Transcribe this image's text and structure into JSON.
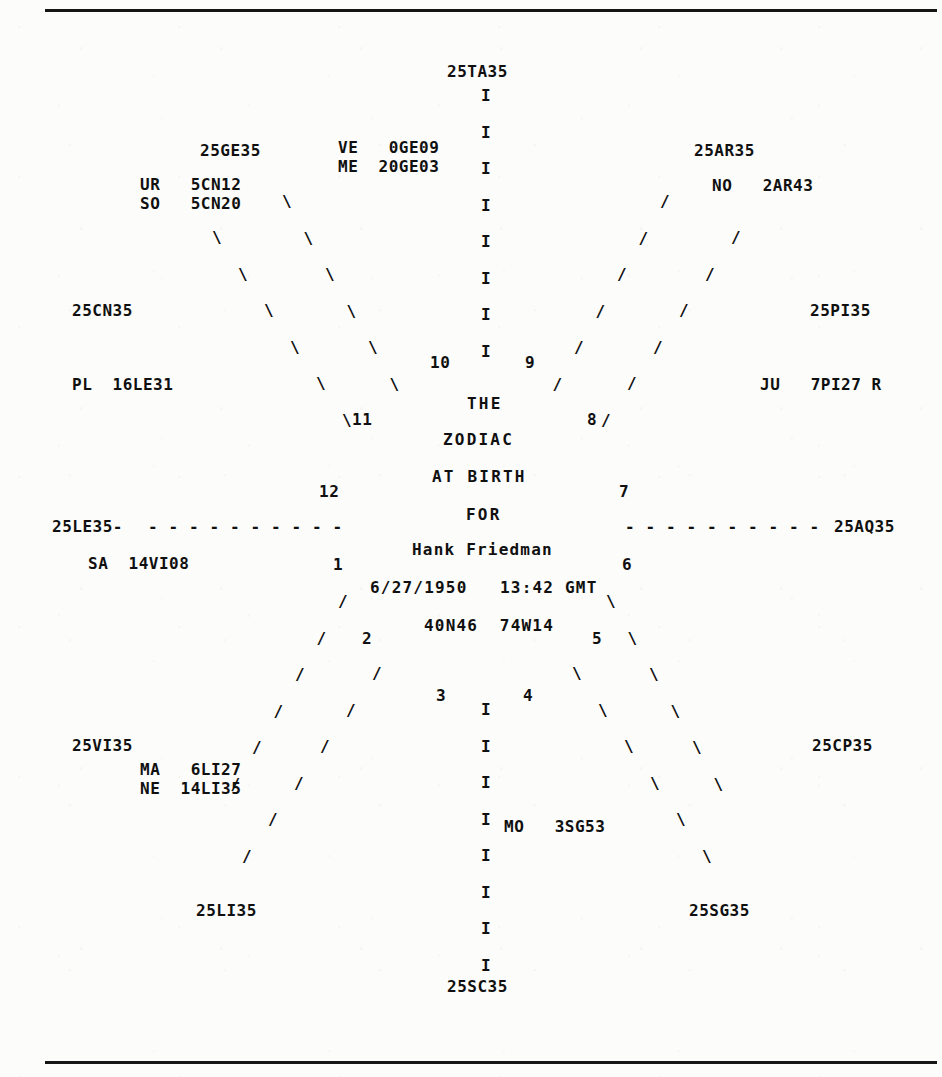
{
  "document": {
    "type": "natal-chart-printout",
    "background_color": "#fcfcfa",
    "ink_color": "#101010",
    "rules": {
      "top_label": "top-horizontal-rule",
      "bottom_label": "bottom-horizontal-rule"
    }
  },
  "center": {
    "line1": "THE",
    "line2": "ZODIAC",
    "line3": "AT BIRTH",
    "line4": "FOR",
    "name": "Hank Friedman",
    "datetime": "6/27/1950   13:42 GMT",
    "coordinates": "40N46  74W14"
  },
  "cusps": {
    "asc": "25LE35",
    "desc": "25AQ35",
    "mc": "25TA35",
    "ic": "25SC35",
    "h11": "25GE35",
    "h12": "25CN35",
    "h2": "25VI35",
    "h3": "25LI35",
    "h9": "25AR35",
    "h8": "25PI35",
    "h5": "25SG35",
    "h6": "25CP35"
  },
  "planets": [
    {
      "abbr": "UR",
      "position": "5CN12",
      "label": "UR   5CN12"
    },
    {
      "abbr": "SO",
      "position": "5CN20",
      "label": "SO   5CN20"
    },
    {
      "abbr": "VE",
      "position": "0GE09",
      "label": "VE   0GE09"
    },
    {
      "abbr": "ME",
      "position": "20GE03",
      "label": "ME  20GE03"
    },
    {
      "abbr": "NO",
      "position": "2AR43",
      "label": "NO   2AR43"
    },
    {
      "abbr": "PL",
      "position": "16LE31",
      "label": "PL  16LE31"
    },
    {
      "abbr": "JU",
      "position": "7PI27 R",
      "label": "JU   7PI27 R"
    },
    {
      "abbr": "SA",
      "position": "14VI08",
      "label": "SA  14VI08"
    },
    {
      "abbr": "MA",
      "position": "6LI27",
      "label": "MA   6LI27"
    },
    {
      "abbr": "NE",
      "position": "14LI35",
      "label": "NE  14LI35"
    },
    {
      "abbr": "MO",
      "position": "3SG53",
      "label": "MO   3SG53"
    }
  ],
  "houses": {
    "h1": "1",
    "h2": "2",
    "h3": "3",
    "h4": "4",
    "h5": "5",
    "h6": "6",
    "h7": "7",
    "h8": "8",
    "h9": "9",
    "h10": "10",
    "h11": "11",
    "h12": "12"
  },
  "glyphs": {
    "vertical": "I",
    "dash": "-",
    "slash": "/",
    "backslash": "\\",
    "asc_trailing_dash": "25LE35-"
  }
}
